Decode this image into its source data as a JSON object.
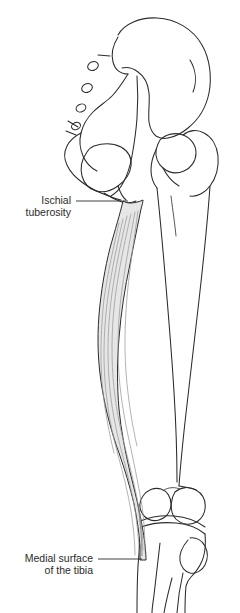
{
  "figure": {
    "background_color": "#ffffff",
    "outline_color": "#2b2b2b",
    "muscle_fill_color": "#e6e6e6",
    "muscle_fiber_color": "#9a9a9a",
    "label_text_color": "#2b2b2b",
    "leader_line_color": "#2b2b2b"
  },
  "labels": [
    {
      "id": "ischial-tuberosity",
      "line1": "Ischial",
      "line2": "tuberosity",
      "text_x": 71,
      "text_y1": 204,
      "text_y2": 216,
      "leader": {
        "x1": 76,
        "y1": 201,
        "x2": 128,
        "y2": 201
      }
    },
    {
      "id": "medial-surface-tibia",
      "line1": "Medial surface",
      "line2": "of the tibia",
      "text_x": 93,
      "text_y1": 562,
      "text_y2": 574,
      "leader": {
        "x1": 98,
        "y1": 559,
        "x2": 142,
        "y2": 559
      }
    }
  ],
  "structures": [
    {
      "id": "ilium",
      "name": "ilium"
    },
    {
      "id": "iliac-crest",
      "name": "iliac crest"
    },
    {
      "id": "sacrum",
      "name": "sacrum"
    },
    {
      "id": "sacral-foramina",
      "name": "sacral foramina",
      "count": 4
    },
    {
      "id": "obturator-foramen",
      "name": "obturator foramen"
    },
    {
      "id": "ischium",
      "name": "ischium"
    },
    {
      "id": "ischial-tuberosity-bone",
      "name": "ischial tuberosity"
    },
    {
      "id": "femoral-head",
      "name": "head of femur"
    },
    {
      "id": "greater-trochanter",
      "name": "greater trochanter"
    },
    {
      "id": "femoral-shaft",
      "name": "shaft of femur"
    },
    {
      "id": "femoral-condyles",
      "name": "femoral condyles"
    },
    {
      "id": "tibia",
      "name": "tibia"
    },
    {
      "id": "fibula",
      "name": "fibula"
    },
    {
      "id": "gracilis-muscle",
      "name": "gracilis muscle"
    }
  ]
}
